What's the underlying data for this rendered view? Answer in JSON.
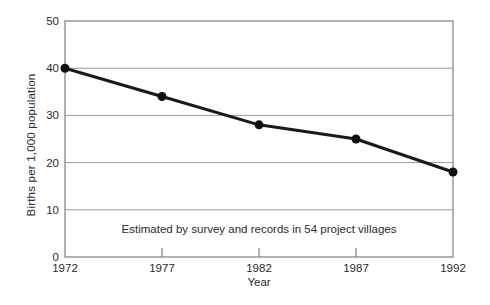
{
  "chart_data": {
    "type": "line",
    "title": "",
    "xlabel": "Year",
    "ylabel": "Births per 1,000 population",
    "note": "Estimated by survey and records in 54 project villages",
    "x": [
      1972,
      1977,
      1982,
      1987,
      1992
    ],
    "series": [
      {
        "name": "Birth rate",
        "values": [
          40,
          34,
          28,
          25,
          18
        ]
      }
    ],
    "xlim": [
      1972,
      1992
    ],
    "ylim": [
      0,
      50
    ],
    "xticks": [
      1972,
      1977,
      1982,
      1987,
      1992
    ],
    "yticks": [
      0,
      10,
      20,
      30,
      40,
      50
    ],
    "grid": "horizontal",
    "legend": "none",
    "colors": {
      "line": "#1a1a1a",
      "marker": "#111111",
      "grid": "#9a9a9a",
      "frame": "#7f7f7f",
      "text": "#2b2b2b",
      "background": "#ffffff"
    }
  }
}
